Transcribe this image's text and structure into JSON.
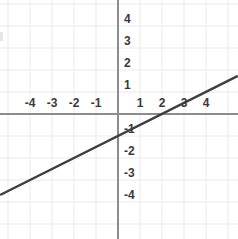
{
  "chart_data": {
    "type": "line",
    "title": "",
    "subtitle": "",
    "xlabel": "",
    "ylabel": "",
    "equation": "y = 0.5x - 1",
    "slope": 0.5,
    "y_intercept": -1,
    "x_intercept": 2,
    "grid": true,
    "legend": "none",
    "xlim": [
      -5.36,
      5.45
    ],
    "ylim": [
      -5.18,
      5.18
    ],
    "x_ticks": [
      -4,
      -3,
      -2,
      -1,
      1,
      2,
      3,
      4
    ],
    "y_ticks": [
      4,
      3,
      2,
      1,
      -1,
      -2,
      -3,
      -4
    ],
    "x_tick_labels": [
      "-4",
      "-3",
      "-2",
      "-1",
      "1",
      "2",
      "3",
      "4"
    ],
    "y_tick_labels": [
      "4",
      "3",
      "2",
      "1",
      "-1",
      "-2",
      "-3",
      "-4"
    ],
    "series": [
      {
        "name": "line",
        "points": [
          {
            "x": -5.36,
            "y": -3.68
          },
          {
            "x": 5.45,
            "y": 1.73
          }
        ],
        "sample_points": [
          {
            "x": -4,
            "y": -3
          },
          {
            "x": -2,
            "y": -2
          },
          {
            "x": 0,
            "y": -1
          },
          {
            "x": 2,
            "y": 0
          },
          {
            "x": 4,
            "y": 1
          }
        ]
      }
    ],
    "colors": {
      "line": "#3f3f3f",
      "axis": "#8c8c8c",
      "grid": "#ebebeb",
      "background": "#ffffff",
      "tick_text": "#3a3a3a"
    }
  },
  "geometry": {
    "origin_x": 118,
    "origin_y": 114,
    "unit_px": 22,
    "width": 238,
    "height": 239
  }
}
